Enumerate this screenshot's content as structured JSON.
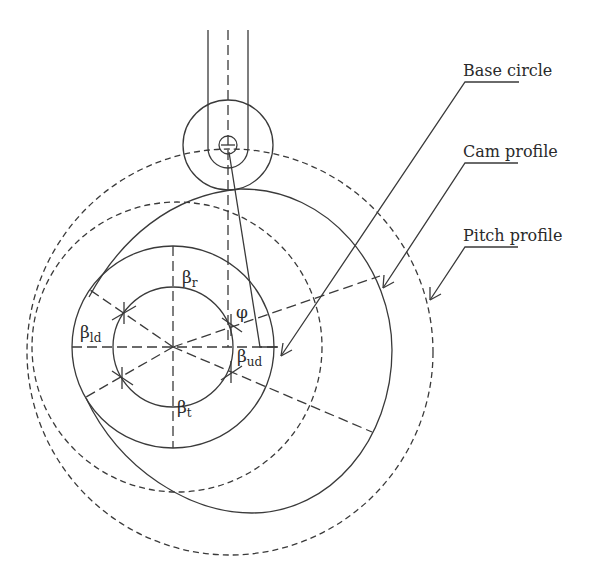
{
  "diagram": {
    "type": "cam-follower-layout",
    "callouts": [
      {
        "id": "base",
        "label": "Base circle"
      },
      {
        "id": "cam",
        "label": "Cam profile"
      },
      {
        "id": "pitch",
        "label": "Pitch profile"
      }
    ],
    "symbols": {
      "beta": "β",
      "phi": "φ",
      "rise": {
        "base": "β",
        "sub": "r"
      },
      "upper_dwell": {
        "base": "β",
        "sub": "ud"
      },
      "return": {
        "base": "β",
        "sub": "t"
      },
      "lower_dwell": {
        "base": "β",
        "sub": "ld"
      },
      "pressure_angle": "φ"
    },
    "colors": {
      "stroke": "#3a3a3a",
      "text": "#2a2a2a",
      "background": "#ffffff"
    }
  }
}
